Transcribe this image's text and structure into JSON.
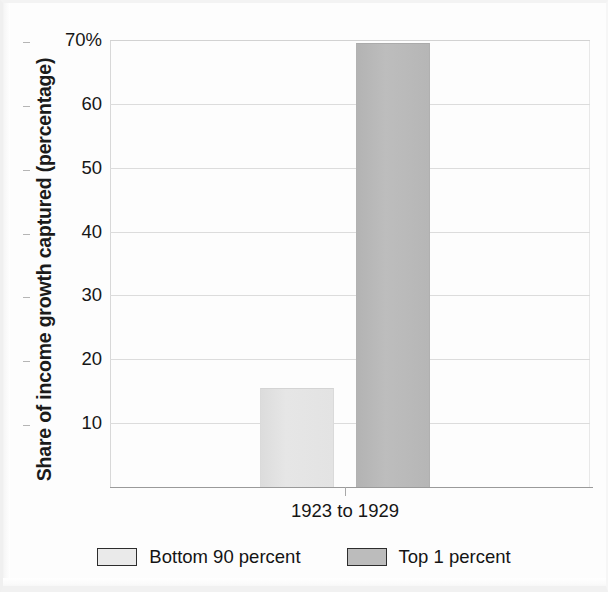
{
  "chart_data": {
    "type": "bar",
    "title": "",
    "xlabel": "",
    "ylabel": "Share of income growth captured (percentage)",
    "categories": [
      "1923 to 1929"
    ],
    "series": [
      {
        "name": "Bottom 90 percent",
        "values": [
          15.5
        ],
        "color": "#e2e2e2"
      },
      {
        "name": "Top 1 percent",
        "values": [
          69.5
        ],
        "color": "#b9b9b9"
      }
    ],
    "ylim": [
      0,
      70
    ],
    "y_ticks": [
      {
        "value": 70,
        "label": "70%"
      },
      {
        "value": 60,
        "label": "60"
      },
      {
        "value": 50,
        "label": "50"
      },
      {
        "value": 40,
        "label": "40"
      },
      {
        "value": 30,
        "label": "30"
      },
      {
        "value": 20,
        "label": "20"
      },
      {
        "value": 10,
        "label": "10"
      }
    ],
    "x_tick_labels": [
      "1923 to 1929"
    ],
    "grid": true,
    "legend_position": "bottom"
  },
  "axis": {
    "y_title": "Share of income growth captured (percentage)",
    "y_labels": [
      "70%",
      "60",
      "50",
      "40",
      "30",
      "20",
      "10"
    ],
    "x_label": "1923 to 1929"
  },
  "legend": {
    "items": [
      {
        "label": "Bottom 90 percent",
        "swatch": "light-gray-swatch"
      },
      {
        "label": "Top 1 percent",
        "swatch": "dark-gray-swatch"
      }
    ]
  },
  "bars": [
    {
      "series": "Bottom 90 percent",
      "category": "1923 to 1929",
      "value": 15.5
    },
    {
      "series": "Top 1 percent",
      "category": "1923 to 1929",
      "value": 69.5
    }
  ]
}
